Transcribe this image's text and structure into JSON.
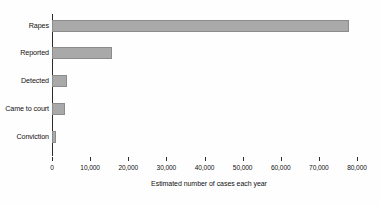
{
  "chart_data": {
    "type": "bar",
    "orientation": "horizontal",
    "title": "",
    "subtitle": "",
    "xlabel": "Estimated number of cases each year",
    "ylabel": "",
    "categories": [
      "Rapes",
      "Reported",
      "Detected",
      "Came to court",
      "Conviction"
    ],
    "values": [
      78000,
      15700,
      3900,
      3400,
      1000
    ],
    "series": [
      {
        "name": "Estimated number of cases each year",
        "values": [
          78000,
          15700,
          3900,
          3400,
          1000
        ]
      }
    ],
    "xlim": [
      0,
      80000
    ],
    "xticks": [
      0,
      10000,
      20000,
      30000,
      40000,
      50000,
      60000,
      70000,
      80000
    ],
    "xtick_labels": [
      "0",
      "10,000",
      "20,000",
      "30,000",
      "40,000",
      "50,000",
      "60,000",
      "70,000",
      "80,000"
    ],
    "grid": false,
    "legend": false,
    "legend_position": "none",
    "bar_color": "#a9a9a9",
    "bar_edge_color": "#8c8c8c",
    "axis_color": "#2b2b2b",
    "background_color": "#fefefe",
    "text_color": "#111111"
  }
}
